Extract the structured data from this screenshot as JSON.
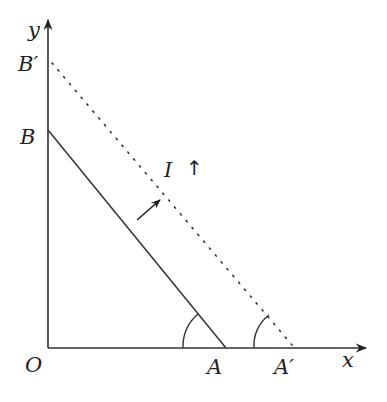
{
  "diagram": {
    "axes": {
      "x_label": "x",
      "y_label": "y",
      "origin_label": "O"
    },
    "points": {
      "A": "A",
      "A_prime": "A′",
      "B": "B",
      "B_prime": "B′"
    },
    "annotation": {
      "text": "I",
      "arrow": "↑"
    },
    "segments": [
      {
        "from": "B",
        "to": "A",
        "style": "solid"
      },
      {
        "from": "B′",
        "to": "A′",
        "style": "dotted"
      }
    ],
    "angle_marks": [
      "A",
      "A′"
    ],
    "shift_arrow": "direction of line translation"
  }
}
